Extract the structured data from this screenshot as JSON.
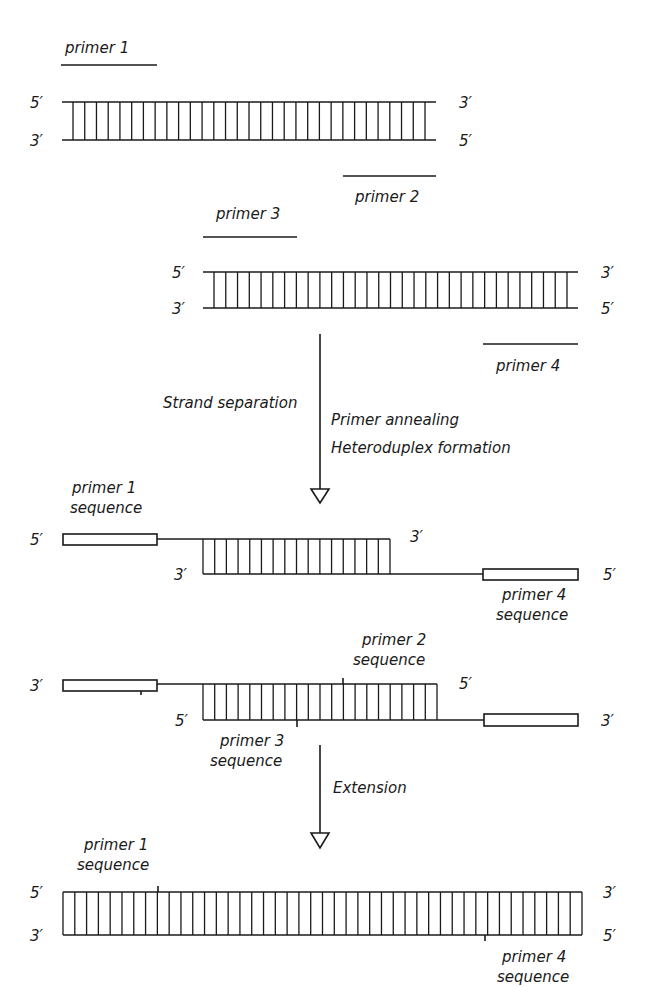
{
  "figure": {
    "stage1": {
      "primer_top_label": "primer 1",
      "primer_bottom_label": "primer 2",
      "end_labels": {
        "top_left": "5′",
        "bottom_left": "3′",
        "top_right": "3′",
        "bottom_right": "5′"
      }
    },
    "stage2": {
      "primer_top_label": "primer 3",
      "primer_bottom_label": "primer 4",
      "end_labels": {
        "top_left": "5′",
        "bottom_left": "3′",
        "top_right": "3′",
        "bottom_right": "5′"
      }
    },
    "step1": {
      "left_label": "Strand separation",
      "right_label_1": "Primer annealing",
      "right_label_2": "Heteroduplex formation"
    },
    "heteroduplex1": {
      "primer_top_label_1": "primer 1",
      "primer_top_label_2": "sequence",
      "primer_bottom_label_1": "primer 4",
      "primer_bottom_label_2": "sequence",
      "end_labels": {
        "top_left": "5′",
        "inner_bottom_left": "3′",
        "inner_top_right": "3′",
        "bottom_right": "5′"
      }
    },
    "heteroduplex2": {
      "primer_top_label_1": "primer 2",
      "primer_top_label_2": "sequence",
      "primer_bottom_label_1": "primer 3",
      "primer_bottom_label_2": "sequence",
      "end_labels": {
        "top_left": "3′",
        "inner_bottom_left": "5′",
        "inner_top_right": "5′",
        "bottom_right": "3′"
      }
    },
    "step2": {
      "right_label": "Extension"
    },
    "product": {
      "primer_top_label_1": "primer 1",
      "primer_top_label_2": "sequence",
      "primer_bottom_label_1": "primer 4",
      "primer_bottom_label_2": "sequence",
      "end_labels": {
        "top_left": "5′",
        "bottom_left": "3′",
        "top_right": "3′",
        "bottom_right": "5′"
      }
    }
  }
}
